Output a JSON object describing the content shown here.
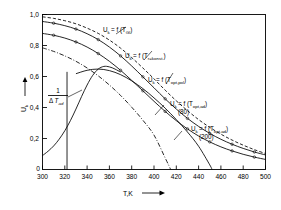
{
  "chart_data": {
    "type": "line",
    "title": "",
    "xlabel": "T,K",
    "ylabel": "U_k",
    "xlim": [
      300,
      500
    ],
    "ylim": [
      0,
      1.0
    ],
    "xticks": [
      "300",
      "320",
      "340",
      "360",
      "380",
      "400",
      "420",
      "440",
      "460",
      "480",
      "500"
    ],
    "yticks": [
      "0",
      "0,2",
      "0,4",
      "0,6",
      "0,8",
      "1,0"
    ],
    "grid": false,
    "legend_position": "inline-annotations",
    "annotations": {
      "fraction_numerator": "1",
      "fraction_denominator_delta": "Δ",
      "fraction_denominator_symbol": "T",
      "fraction_denominator_sub": "ad",
      "xaxis_arrow": "⟶",
      "yaxis_arrow": "↑"
    },
    "series": [
      {
        "name": "Uk = f (TGl)",
        "label_main": "U",
        "label_sub": "k",
        "label_eq": " = f (T",
        "label_arg_sub": "Gl",
        "label_close": ")",
        "label_extra": "",
        "style": "dashed",
        "markers": false,
        "x": [
          300,
          310,
          320,
          330,
          340,
          350,
          360,
          370,
          380,
          390,
          400,
          410,
          420,
          430,
          440,
          450,
          460,
          470,
          480,
          490,
          500
        ],
        "y": [
          0.985,
          0.975,
          0.96,
          0.94,
          0.912,
          0.878,
          0.835,
          0.783,
          0.722,
          0.655,
          0.585,
          0.512,
          0.443,
          0.38,
          0.322,
          0.272,
          0.228,
          0.19,
          0.157,
          0.128,
          0.103
        ]
      },
      {
        "name": "Uk = f (Tr=konst.)",
        "label_main": "U",
        "label_sub": "k",
        "label_eq": " = f (T",
        "label_arg_sub": "r=konst.",
        "label_close": ")",
        "label_extra": "",
        "style": "solid",
        "markers": true,
        "x": [
          300,
          310,
          320,
          330,
          340,
          350,
          360,
          370,
          380,
          390,
          400,
          410,
          420,
          430,
          440,
          450,
          460,
          470,
          480,
          490,
          500
        ],
        "y": [
          0.955,
          0.944,
          0.928,
          0.906,
          0.876,
          0.838,
          0.79,
          0.733,
          0.668,
          0.598,
          0.527,
          0.456,
          0.39,
          0.33,
          0.278,
          0.233,
          0.195,
          0.163,
          0.136,
          0.113,
          0.094
        ]
      },
      {
        "name": "Uk = f (Topt,pol)",
        "label_main": "U",
        "label_sub": "k",
        "label_eq": " = f (T",
        "label_arg_sub": "opt,pol",
        "label_close": ")",
        "label_extra": "",
        "style": "solid",
        "markers": true,
        "x": [
          300,
          310,
          320,
          330,
          340,
          350,
          360,
          370,
          380,
          390,
          400,
          410,
          420,
          430,
          440,
          450,
          460,
          470,
          480,
          490,
          500
        ],
        "y": [
          0.878,
          0.866,
          0.848,
          0.823,
          0.79,
          0.748,
          0.698,
          0.64,
          0.575,
          0.508,
          0.44,
          0.375,
          0.315,
          0.262,
          0.216,
          0.178,
          0.146,
          0.12,
          0.098,
          0.08,
          0.065
        ]
      },
      {
        "name": "Uk = f (Topt,ad) (80)",
        "label_main": "U",
        "label_sub": "k",
        "label_eq": " = f (T",
        "label_arg_sub": "opt,ad",
        "label_close": ")",
        "label_extra": "(80)",
        "style": "dashdot",
        "markers": false,
        "x": [
          300,
          310,
          320,
          330,
          340,
          350,
          360,
          370,
          380,
          390,
          400,
          410,
          415
        ],
        "y": [
          0.785,
          0.762,
          0.733,
          0.698,
          0.655,
          0.604,
          0.545,
          0.478,
          0.402,
          0.318,
          0.222,
          0.075,
          0.0
        ]
      },
      {
        "name": "Uk = f (Topt,ad) (200)",
        "label_main": "U",
        "label_sub": "k",
        "label_eq": " = f (T",
        "label_arg_sub": "opt,ad",
        "label_close": ")",
        "label_extra": "(200)",
        "style": "solid",
        "markers": false,
        "x": [
          330,
          340,
          350,
          360,
          370,
          380,
          390,
          400,
          410,
          420,
          430,
          440,
          450,
          452
        ],
        "y": [
          0.618,
          0.64,
          0.648,
          0.638,
          0.612,
          0.572,
          0.522,
          0.462,
          0.396,
          0.322,
          0.242,
          0.15,
          0.03,
          0.0
        ]
      },
      {
        "name": "1/dTad",
        "label_main": "",
        "label_sub": "",
        "label_eq": "",
        "label_arg_sub": "",
        "label_close": "",
        "label_extra": "",
        "style": "solid",
        "markers": false,
        "x": [
          300,
          305,
          310,
          315,
          320,
          325,
          330,
          335,
          340,
          345,
          350,
          355,
          360,
          365,
          370
        ],
        "y": [
          0.09,
          0.118,
          0.152,
          0.196,
          0.25,
          0.315,
          0.39,
          0.47,
          0.545,
          0.607,
          0.648,
          0.665,
          0.662,
          0.648,
          0.628
        ]
      }
    ],
    "vertical_drop": {
      "x": 322,
      "y_top": 0.63,
      "y_bottom": 0.0
    }
  },
  "labels": {
    "t_gl": {
      "main": "U",
      "sub": "k",
      "eq": "= f (T",
      "arg": "Gl",
      "close": ")"
    },
    "t_rkonst": {
      "main": "U",
      "sub": "k",
      "eq": "= f (T",
      "arg": "r=konst.",
      "close": ")"
    },
    "t_optpol": {
      "main": "U",
      "sub": "k",
      "eq": "= f (T",
      "arg": "opt,pol",
      "close": ")"
    },
    "t_optad80": {
      "main": "U",
      "sub": "k",
      "eq": "= f (T",
      "arg": "opt,ad",
      "close": ")",
      "extra": "(80)"
    },
    "t_optad200": {
      "main": "U",
      "sub": "k",
      "eq": "= f (T",
      "arg": "opt,ad",
      "close": ")",
      "extra": "(200)"
    },
    "fraction": {
      "num": "1",
      "delta": "Δ",
      "sym": "T",
      "sub": "ad"
    },
    "yaxis": {
      "main": "U",
      "sub": "k"
    },
    "xaxis": {
      "text": "T,K"
    }
  },
  "ticks": {
    "x": [
      "300",
      "320",
      "340",
      "360",
      "380",
      "400",
      "420",
      "440",
      "460",
      "480",
      "500"
    ],
    "y": [
      "1,0",
      "0,8",
      "0,6",
      "0,4",
      "0,2",
      "0"
    ]
  },
  "colors": {
    "ink": "#000000",
    "paper": "#ffffff"
  }
}
